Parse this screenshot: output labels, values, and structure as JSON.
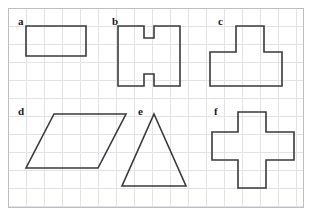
{
  "page": {
    "background_color": "#ffffff"
  },
  "grid": {
    "cell_size": 18,
    "line_color": "#e2e2e8",
    "border_color": "#bdbdc6",
    "origin_x": 8,
    "origin_y": 8,
    "width": 296,
    "height": 200,
    "columns": 16,
    "rows": 11
  },
  "style": {
    "shape_stroke_color": "#3a3a3a",
    "shape_stroke_width": 1.6,
    "shape_fill": "none",
    "label_color": "#1a1a1a"
  },
  "shapes": [
    {
      "id": "a",
      "label": "a",
      "name": "rectangle",
      "label_x": 10,
      "label_y": 8,
      "points": "18,18 78,18 78,48 18,48"
    },
    {
      "id": "b",
      "label": "b",
      "name": "h-shape",
      "label_x": 104,
      "label_y": 8,
      "points": "110,18 136,18 136,30 146,30 146,18 172,18 172,78 146,78 146,66 136,66 136,78 110,78"
    },
    {
      "id": "c",
      "label": "c",
      "name": "t-shape",
      "label_x": 210,
      "label_y": 8,
      "points": "228,18 256,18 256,44 274,44 274,78 202,78 202,44 228,44"
    },
    {
      "id": "d",
      "label": "d",
      "name": "parallelogram",
      "label_x": 10,
      "label_y": 98,
      "points": "46,106 118,106 90,160 18,160"
    },
    {
      "id": "e",
      "label": "e",
      "name": "triangle",
      "label_x": 130,
      "label_y": 98,
      "points": "146,106 178,178 114,178"
    },
    {
      "id": "f",
      "label": "f",
      "name": "plus-cross",
      "label_x": 206,
      "label_y": 98,
      "points": "230,104 258,104 258,124 286,124 286,152 258,152 258,180 230,180 230,152 204,152 204,124 230,124"
    }
  ]
}
